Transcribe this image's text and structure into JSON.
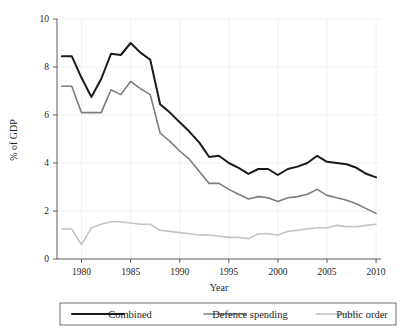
{
  "chart_data": {
    "type": "line",
    "title": "",
    "xlabel": "Year",
    "ylabel": "% of GDP",
    "xlim": [
      1977.5,
      2010.5
    ],
    "ylim": [
      0,
      10
    ],
    "xticks": [
      1980,
      1985,
      1990,
      1995,
      2000,
      2005,
      2010
    ],
    "yticks": [
      0,
      2,
      4,
      6,
      8,
      10
    ],
    "xtick_labels": [
      "1980",
      "1985",
      "1990",
      "1995",
      "2000",
      "2005",
      "2010"
    ],
    "ytick_labels": [
      "0",
      "2",
      "4",
      "6",
      "8",
      "10"
    ],
    "grid": true,
    "legend_position": "bottom",
    "x": [
      1978,
      1979,
      1980,
      1981,
      1982,
      1983,
      1984,
      1985,
      1986,
      1987,
      1988,
      1989,
      1990,
      1991,
      1992,
      1993,
      1994,
      1995,
      1996,
      1997,
      1998,
      1999,
      2000,
      2001,
      2002,
      2003,
      2004,
      2005,
      2006,
      2007,
      2008,
      2009,
      2010
    ],
    "series": [
      {
        "name": "Combined",
        "color": "#1a1a1a",
        "width": 2.0,
        "values": [
          8.45,
          8.45,
          7.55,
          6.75,
          7.5,
          8.55,
          8.5,
          9.0,
          8.6,
          8.3,
          6.45,
          6.1,
          5.7,
          5.3,
          4.85,
          4.25,
          4.3,
          4.0,
          3.8,
          3.55,
          3.75,
          3.75,
          3.5,
          3.75,
          3.85,
          4.0,
          4.3,
          4.05,
          4.0,
          3.95,
          3.8,
          3.55,
          3.4
        ]
      },
      {
        "name": "Defence spending",
        "color": "#7d7d7d",
        "width": 1.6,
        "values": [
          7.2,
          7.2,
          6.1,
          6.1,
          6.1,
          7.05,
          6.85,
          7.4,
          7.1,
          6.85,
          5.25,
          4.9,
          4.5,
          4.15,
          3.65,
          3.15,
          3.15,
          2.9,
          2.7,
          2.5,
          2.6,
          2.55,
          2.4,
          2.55,
          2.6,
          2.7,
          2.9,
          2.65,
          2.55,
          2.45,
          2.3,
          2.1,
          1.9
        ]
      },
      {
        "name": "Public order",
        "color": "#c4c4c4",
        "width": 1.6,
        "values": [
          1.25,
          1.25,
          0.6,
          1.3,
          1.45,
          1.55,
          1.55,
          1.5,
          1.45,
          1.45,
          1.2,
          1.15,
          1.1,
          1.05,
          1.0,
          1.0,
          0.95,
          0.9,
          0.9,
          0.85,
          1.05,
          1.05,
          1.0,
          1.15,
          1.2,
          1.25,
          1.3,
          1.3,
          1.4,
          1.35,
          1.35,
          1.4,
          1.45
        ]
      }
    ]
  },
  "legend": {
    "items": [
      {
        "label": "Combined",
        "color": "#1a1a1a"
      },
      {
        "label": "Defence spending",
        "color": "#7d7d7d"
      },
      {
        "label": "Public order",
        "color": "#c4c4c4"
      }
    ]
  },
  "axes": {
    "x_title": "Year",
    "y_title": "% of GDP"
  }
}
